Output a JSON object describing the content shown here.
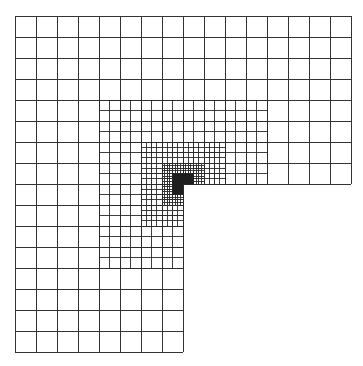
{
  "figure": {
    "line_color": "#2a2a2a",
    "background": "#ffffff",
    "dense_fill": "#1e1e1e"
  },
  "mesh": {
    "origin_x": 15,
    "origin_y": 16,
    "coarse_cell": 21,
    "coarse_cells_per_side": 16,
    "removed_quadrant": {
      "col_from": 8,
      "col_to": 16,
      "row_from": 8,
      "row_to": 16
    },
    "reentrant_corner": {
      "col": 8,
      "row": 8
    },
    "refinement_levels": [
      {
        "level": 1,
        "subdivisions": 2,
        "col_from": 4,
        "col_to": 12,
        "row_from": 4,
        "row_to": 12
      },
      {
        "level": 2,
        "subdivisions": 4,
        "col_from": 6,
        "col_to": 10,
        "row_from": 6,
        "row_to": 10
      },
      {
        "level": 3,
        "subdivisions": 8,
        "col_from": 7,
        "col_to": 9,
        "row_from": 7,
        "row_to": 9
      },
      {
        "level": 4,
        "subdivisions": 16,
        "col_from": 7.5,
        "col_to": 8.5,
        "row_from": 7.5,
        "row_to": 8.5,
        "dense": true
      }
    ]
  }
}
